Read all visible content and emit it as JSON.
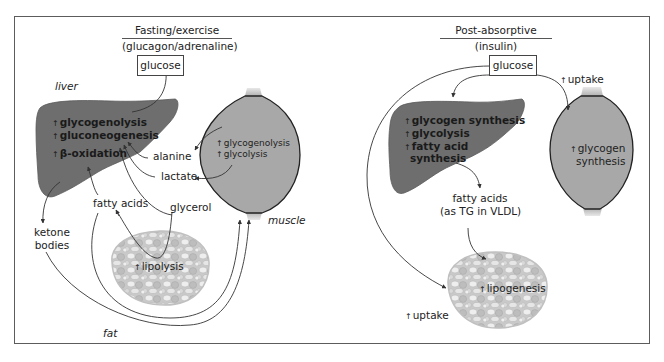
{
  "left_panel": {
    "title": "Fasting/exercise",
    "subtitle": "(glucagon/adrenaline)",
    "glucose_box": "glucose",
    "organs": {
      "liver_label": "liver",
      "muscle_label": "muscle",
      "fat_label": "fat"
    },
    "liver_processes": [
      "glycogenolysis",
      "gluconeogenesis",
      "β-oxidation"
    ],
    "muscle_processes": [
      "glycogenolysis",
      "glycolysis"
    ],
    "fat_processes": [
      "lipolysis"
    ],
    "metabolites": {
      "alanine": "alanine",
      "lactate": "lactate",
      "fatty_acids": "fatty acids",
      "glycerol": "glycerol",
      "ketone_bodies_line1": "ketone",
      "ketone_bodies_line2": "bodies"
    }
  },
  "right_panel": {
    "title": "Post-absorptive",
    "subtitle": "(insulin)",
    "glucose_box": "glucose",
    "liver_processes": [
      "glycogen synthesis",
      "glycolysis",
      "fatty acid",
      "synthesis"
    ],
    "muscle_processes": [
      "glycogen",
      "synthesis"
    ],
    "fat_processes": [
      "lipogenesis"
    ],
    "metabolites": {
      "fatty_acids_line1": "fatty acids",
      "fatty_acids_line2": "(as TG in VLDL)",
      "uptake_muscle": "uptake",
      "uptake_fat": "uptake"
    }
  },
  "colors": {
    "liver": "#6e6e6e",
    "muscle": "#a8a8a8",
    "fat_bg": "#cfcfcf",
    "fat_cell": "#eeeeee",
    "arrow": "#333333",
    "frame": "#5c5c5c"
  }
}
